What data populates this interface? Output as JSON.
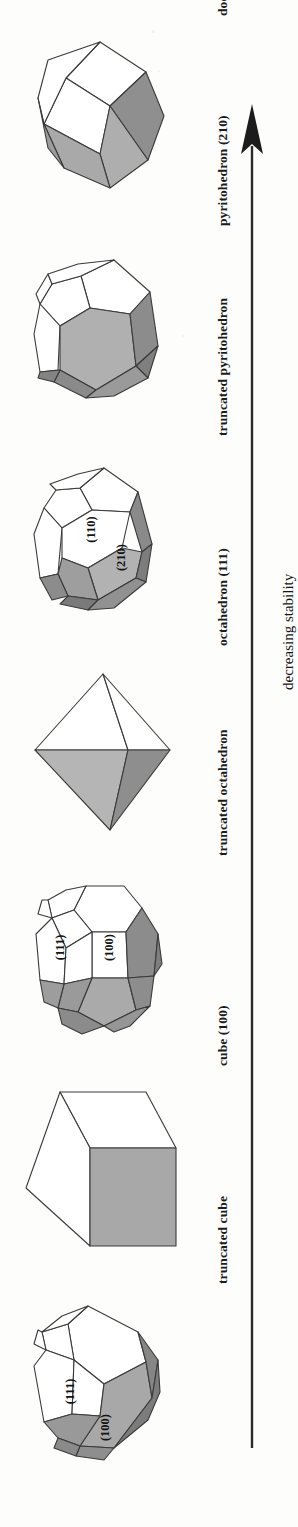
{
  "figure": {
    "type": "crystal-habit-sequence-diagram",
    "orientation": "rotated-90-ccw",
    "axis": {
      "label": "decreasing stability",
      "direction": "up",
      "arrowhead": "top"
    },
    "shapes": [
      {
        "id": "dodecahedron",
        "caption": "dodecahedron (110)",
        "face_labels": []
      },
      {
        "id": "pyritohedron",
        "caption": "pyritohedron (210)",
        "face_labels": []
      },
      {
        "id": "truncated-pyritohedron",
        "caption": "truncated pyritohedron",
        "face_labels": [
          "(110)",
          "(210)"
        ]
      },
      {
        "id": "octahedron",
        "caption": "octahedron (111)",
        "face_labels": []
      },
      {
        "id": "truncated-octahedron",
        "caption": "truncated octahedron",
        "face_labels": [
          "(111)",
          "(100)"
        ]
      },
      {
        "id": "cube",
        "caption": "cube (100)",
        "face_labels": []
      },
      {
        "id": "truncated-cube",
        "caption": "truncated cube",
        "face_labels": [
          "(111)",
          "(100)"
        ]
      }
    ],
    "colors": {
      "outline": "#3a3a3a",
      "face_white": "#ffffff",
      "face_gray_light": "#b4b4b4",
      "face_gray_dark": "#8f8f8f",
      "background": "#fdfdfc",
      "text": "#151515"
    }
  }
}
